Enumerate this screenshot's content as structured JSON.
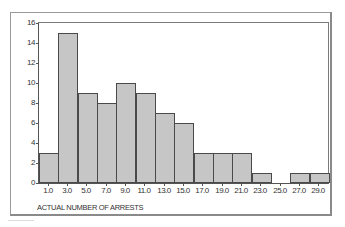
{
  "chart_data": {
    "type": "bar",
    "title": "",
    "xlabel": "ACTUAL NUMBER OF ARRESTS",
    "ylabel": "",
    "categories": [
      "1.0",
      "3.0",
      "5.0",
      "7.0",
      "9.0",
      "11.0",
      "13.0",
      "15.0",
      "17.0",
      "19.0",
      "21.0",
      "23.0",
      "25.0",
      "27.0",
      "29.0"
    ],
    "values": [
      3,
      15,
      9,
      8,
      10,
      9,
      7,
      6,
      3,
      3,
      3,
      1,
      0,
      1,
      1
    ],
    "yticks": [
      "0",
      "2",
      "4",
      "6",
      "8",
      "10",
      "12",
      "14",
      "16"
    ],
    "ylim": [
      0,
      16
    ],
    "grid": false,
    "legend": null,
    "bar_color": "#c6c6c6",
    "bar_edge_color": "#4a4a4a"
  }
}
